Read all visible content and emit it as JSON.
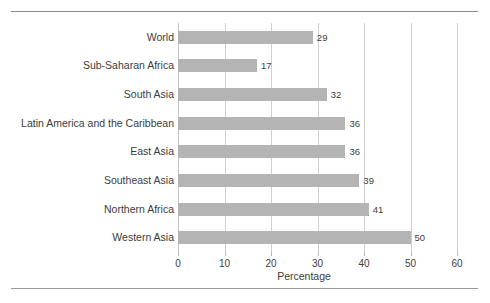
{
  "chart_data": {
    "type": "bar",
    "orientation": "horizontal",
    "title": "",
    "subtitle": "",
    "xlabel": "Percentage",
    "ylabel": "",
    "xlim": [
      0,
      60
    ],
    "xticks": [
      0,
      10,
      20,
      30,
      40,
      50,
      60
    ],
    "xtick_labels": [
      "0",
      "10",
      "20",
      "30",
      "40",
      "50",
      "60"
    ],
    "grid": "vertical",
    "legend": null,
    "categories": [
      "World",
      "Sub-Saharan Africa",
      "South Asia",
      "Latin America and the Caribbean",
      "East Asia",
      "Southeast Asia",
      "Northern Africa",
      "Western Asia"
    ],
    "values": [
      29,
      17,
      32,
      36,
      36,
      39,
      41,
      50
    ],
    "value_labels": [
      "29",
      "17",
      "32",
      "36",
      "36",
      "39",
      "41",
      "50"
    ],
    "bar_color": "#b4b4b4",
    "gridline_color": "#cfcfcf",
    "text_color": "#3c3c3c",
    "background_color": "#ffffff"
  }
}
